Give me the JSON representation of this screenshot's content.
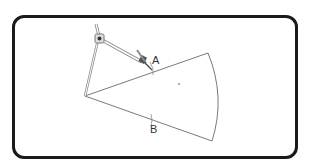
{
  "diagram": {
    "type": "geometric-construction",
    "labels": {
      "point_a": "A",
      "point_b": "B"
    },
    "colors": {
      "frame": "#1a1a1a",
      "lines": "#777777",
      "compass": "#888888",
      "label": "#333333"
    }
  }
}
